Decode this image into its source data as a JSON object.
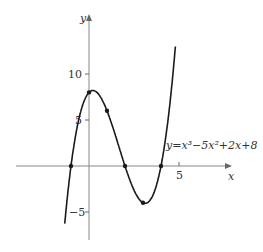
{
  "chart_data": {
    "type": "line",
    "title": "",
    "function": "y = x^3 - 5x^2 + 2x + 8",
    "curve_label": "y=x³−5x²+2x+8",
    "xlabel": "x",
    "ylabel": "y",
    "x_ticks": [
      {
        "value": 5,
        "label": "5"
      }
    ],
    "y_ticks": [
      {
        "value": 10,
        "label": "10"
      },
      {
        "value": 5,
        "label": "5"
      },
      {
        "value": -5,
        "label": "−5"
      }
    ],
    "xlim": [
      -4,
      8
    ],
    "ylim": [
      -8,
      17
    ],
    "grid": false,
    "legend": null,
    "marked_points": [
      {
        "x": -1,
        "y": 0
      },
      {
        "x": 0,
        "y": 8
      },
      {
        "x": 1,
        "y": 6
      },
      {
        "x": 2,
        "y": 0
      },
      {
        "x": 3,
        "y": -4
      },
      {
        "x": 4,
        "y": 0
      }
    ],
    "x": [
      -1.35,
      -1,
      0,
      0.2,
      1,
      2,
      3,
      3.1,
      4,
      4.8
    ],
    "values": [
      -7.9,
      0,
      8,
      8.2,
      6,
      0,
      -4,
      -4.1,
      0,
      15.9
    ],
    "colors": {
      "curve": "#1a1a1a",
      "axes": "#888888"
    }
  }
}
